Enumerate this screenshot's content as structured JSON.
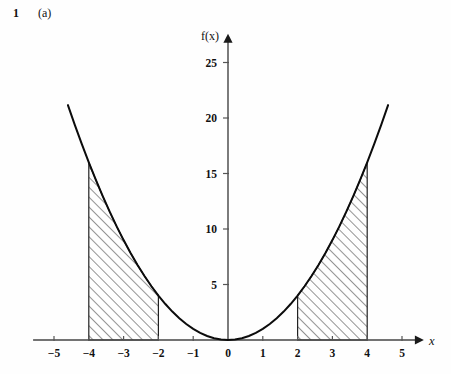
{
  "question": {
    "number": "1",
    "part": "(a)"
  },
  "figure": {
    "y_axis_label": "f(x)",
    "x_axis_label": "x",
    "origin_label": "0"
  },
  "chart_data": {
    "type": "line",
    "title": "",
    "subtitle": "",
    "xlabel": "x",
    "ylabel": "f(x)",
    "function": "f(x) = x^2",
    "grid": false,
    "legend": "none",
    "xlim": [
      -5.6,
      5.6
    ],
    "ylim": [
      -1.5,
      27.5
    ],
    "x_ticks": [
      -5,
      -4,
      -3,
      -2,
      -1,
      0,
      1,
      2,
      3,
      4,
      5
    ],
    "x_tick_labels": [
      "−5",
      "−4",
      "−3",
      "−2",
      "−1",
      "0",
      "1",
      "2",
      "3",
      "4",
      "5"
    ],
    "y_ticks": [
      5,
      10,
      15,
      20,
      25
    ],
    "y_tick_labels": [
      "5",
      "10",
      "15",
      "20",
      "25"
    ],
    "x": [
      -4.6,
      -4.4,
      -4.2,
      -4.0,
      -3.8,
      -3.6,
      -3.4,
      -3.2,
      -3.0,
      -2.8,
      -2.6,
      -2.4,
      -2.2,
      -2.0,
      -1.8,
      -1.6,
      -1.4,
      -1.2,
      -1.0,
      -0.8,
      -0.6,
      -0.4,
      -0.2,
      0.0,
      0.2,
      0.4,
      0.6,
      0.8,
      1.0,
      1.2,
      1.4,
      1.6,
      1.8,
      2.0,
      2.2,
      2.4,
      2.6,
      2.8,
      3.0,
      3.2,
      3.4,
      3.6,
      3.8,
      4.0,
      4.2,
      4.4,
      4.6
    ],
    "y": [
      21.16,
      19.36,
      17.64,
      16.0,
      14.44,
      12.96,
      11.56,
      10.24,
      9.0,
      7.84,
      6.76,
      5.76,
      4.84,
      4.0,
      3.24,
      2.56,
      1.96,
      1.44,
      1.0,
      0.64,
      0.36,
      0.16,
      0.04,
      0.0,
      0.04,
      0.16,
      0.36,
      0.64,
      1.0,
      1.44,
      1.96,
      2.56,
      3.24,
      4.0,
      4.84,
      5.76,
      6.76,
      7.84,
      9.0,
      10.24,
      11.56,
      12.96,
      14.44,
      16.0,
      17.64,
      19.36,
      21.16
    ],
    "shaded_regions": [
      {
        "name": "left-shaded-region",
        "x_from": -4,
        "x_to": -2,
        "hatch": "forward-diagonal"
      },
      {
        "name": "right-shaded-region",
        "x_from": 2,
        "x_to": 4,
        "hatch": "forward-diagonal"
      }
    ]
  }
}
